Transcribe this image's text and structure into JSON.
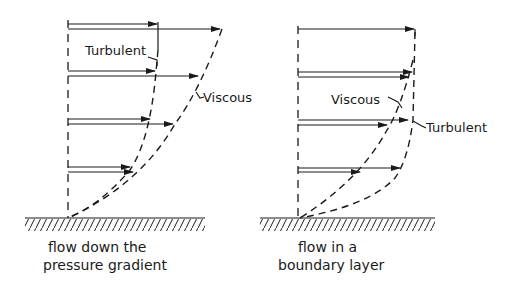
{
  "figure": {
    "panels": [
      {
        "id": "left",
        "labels": {
          "turbulent": "Turbulent",
          "viscous": "Viscous"
        },
        "caption": [
          "flow down the",
          "pressure gradient"
        ]
      },
      {
        "id": "right",
        "labels": {
          "turbulent": "Turbulent",
          "viscous": "Viscous"
        },
        "caption": [
          "flow in a",
          "boundary layer"
        ]
      }
    ],
    "colors": {
      "ink": "#1a1a1a",
      "background": "#ffffff"
    }
  }
}
